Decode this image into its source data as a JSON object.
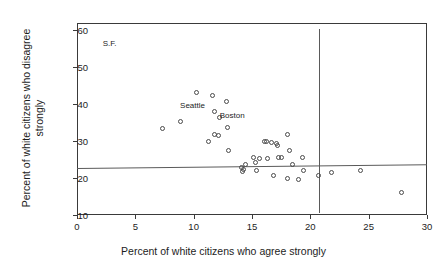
{
  "chart_data": {
    "type": "scatter",
    "title": "",
    "xlabel": "Percent of white citizens who agree strongly",
    "ylabel": "Percent of white citizens who disagree strongly",
    "xlim": [
      0,
      30
    ],
    "ylim": [
      10,
      62
    ],
    "grid": false,
    "legend": null,
    "xticks": [
      0,
      5,
      10,
      15,
      20,
      25,
      30
    ],
    "xticklabels": [
      "0",
      "5",
      "10",
      "15",
      "20",
      "25",
      "30"
    ],
    "yticks": [
      10,
      20,
      30,
      40,
      50,
      60
    ],
    "yticklabels": [
      "10",
      "20",
      "30",
      "40",
      "50",
      "60"
    ],
    "points": [
      {
        "x": 7.3,
        "y": 33.3
      },
      {
        "x": 8.9,
        "y": 35.3
      },
      {
        "x": 10.2,
        "y": 43.1
      },
      {
        "x": 11.3,
        "y": 30.0
      },
      {
        "x": 11.6,
        "y": 42.3
      },
      {
        "x": 11.8,
        "y": 38.0
      },
      {
        "x": 11.8,
        "y": 31.8
      },
      {
        "x": 12.1,
        "y": 31.6
      },
      {
        "x": 12.2,
        "y": 36.4
      },
      {
        "x": 12.8,
        "y": 40.7
      },
      {
        "x": 12.9,
        "y": 33.6
      },
      {
        "x": 13.0,
        "y": 27.4
      },
      {
        "x": 14.1,
        "y": 23.0
      },
      {
        "x": 14.2,
        "y": 21.9
      },
      {
        "x": 14.3,
        "y": 22.3
      },
      {
        "x": 14.4,
        "y": 23.8
      },
      {
        "x": 15.1,
        "y": 25.5
      },
      {
        "x": 15.3,
        "y": 24.2
      },
      {
        "x": 15.4,
        "y": 22.1
      },
      {
        "x": 15.6,
        "y": 25.4
      },
      {
        "x": 16.1,
        "y": 29.9
      },
      {
        "x": 16.2,
        "y": 29.9
      },
      {
        "x": 16.3,
        "y": 25.3
      },
      {
        "x": 16.7,
        "y": 29.7
      },
      {
        "x": 16.8,
        "y": 20.7
      },
      {
        "x": 17.1,
        "y": 29.5
      },
      {
        "x": 17.2,
        "y": 28.8
      },
      {
        "x": 17.3,
        "y": 25.6
      },
      {
        "x": 17.5,
        "y": 25.6
      },
      {
        "x": 18.0,
        "y": 31.8
      },
      {
        "x": 18.0,
        "y": 19.8
      },
      {
        "x": 18.2,
        "y": 27.4
      },
      {
        "x": 18.5,
        "y": 23.8
      },
      {
        "x": 19.0,
        "y": 19.5
      },
      {
        "x": 19.3,
        "y": 25.5
      },
      {
        "x": 19.4,
        "y": 22.1
      },
      {
        "x": 20.7,
        "y": 20.8
      },
      {
        "x": 21.8,
        "y": 21.5
      },
      {
        "x": 24.3,
        "y": 22.0
      },
      {
        "x": 27.8,
        "y": 16.0
      }
    ],
    "annotations": [
      {
        "text": "S.F.",
        "x": 2.8,
        "y": 56.5
      },
      {
        "text": "Seattle",
        "x": 9.9,
        "y": 39.9
      },
      {
        "text": "Boston",
        "x": 13.3,
        "y": 37.2
      }
    ],
    "reference_lines": [
      {
        "orientation": "horizontal",
        "y_left": 22.6,
        "y_right": 23.6
      },
      {
        "orientation": "vertical",
        "x": 20.75,
        "y_from": 10.6,
        "y_to": 60.5
      }
    ]
  }
}
